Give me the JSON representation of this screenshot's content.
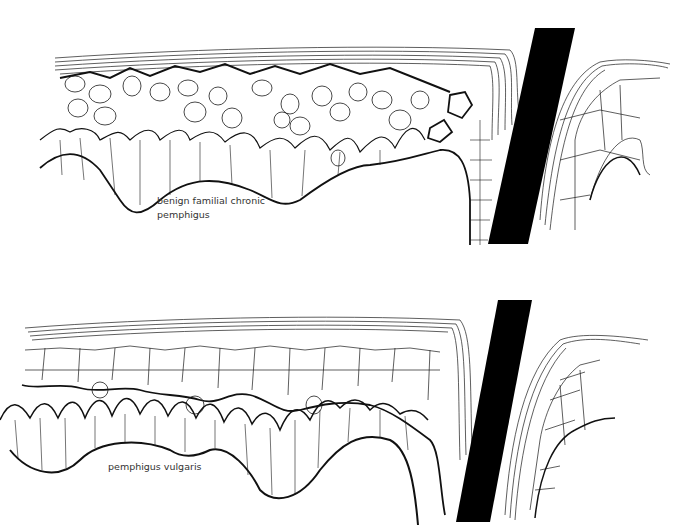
{
  "figure": {
    "panels": [
      {
        "id": "top",
        "label_line1": "benign familial chronic",
        "label_line2": "pemphigus",
        "description": "Epidermis with suprabasal acantholysis; loosely separated keratinocytes in cleft; intact stratum corneum; inset at right after black cut bar"
      },
      {
        "id": "bottom",
        "label_line1": "pemphigus vulgaris",
        "description": "Epidermis with suprabasal cleft; basal layer 'tombstone' cells remain on dermal papillae; cohesive upper epidermis; inset at right after black cut bar"
      }
    ],
    "colors": {
      "line": "#1a1a1a",
      "bar": "#000000",
      "background": "#ffffff",
      "label": "#333333"
    }
  }
}
